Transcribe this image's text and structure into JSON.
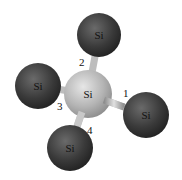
{
  "diagram": {
    "center_atom": {
      "label": "Si",
      "cx": 88,
      "cy": 94,
      "r": 24
    },
    "neighbors": [
      {
        "label": "Si",
        "cx": 99,
        "cy": 35,
        "r": 22,
        "bond": "2"
      },
      {
        "label": "Si",
        "cx": 38,
        "cy": 86,
        "r": 23,
        "bond": "3"
      },
      {
        "label": "Si",
        "cx": 146,
        "cy": 115,
        "r": 23,
        "bond": "1"
      },
      {
        "label": "Si",
        "cx": 70,
        "cy": 148,
        "r": 23,
        "bond": "4"
      }
    ],
    "bond_labels": [
      "1",
      "2",
      "3",
      "4"
    ],
    "colors": {
      "center": "#b8b8b8",
      "neighbor": "#3c3c3c",
      "bond": "#cfcfcf"
    }
  }
}
